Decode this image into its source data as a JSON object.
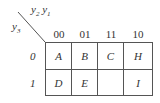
{
  "kmap": {
    "col_var_label": {
      "a": "y",
      "a_sub": "2",
      "b": "y",
      "b_sub": "1"
    },
    "row_var_label": {
      "a": "y",
      "a_sub": "3"
    },
    "col_headers": [
      "00",
      "01",
      "11",
      "10"
    ],
    "row_headers": [
      "0",
      "1"
    ],
    "cells": [
      [
        "A",
        "B",
        "C",
        "H"
      ],
      [
        "D",
        "E",
        "",
        "I"
      ]
    ]
  }
}
